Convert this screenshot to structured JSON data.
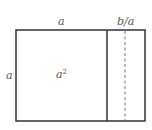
{
  "diagram": {
    "labels": {
      "top_left_side": "a",
      "top_right_strip": "b/a",
      "left_side": "a",
      "square_area_base": "a",
      "square_area_exponent": "2"
    },
    "colors": {
      "stroke": "#333333",
      "dashed": "#777777",
      "text": "#555555",
      "background": "#ffffff"
    },
    "geometry": {
      "outer_rect": {
        "x": 16,
        "y": 30,
        "width": 129,
        "height": 91
      },
      "divider_x": 107,
      "dashed_x": 125
    }
  }
}
